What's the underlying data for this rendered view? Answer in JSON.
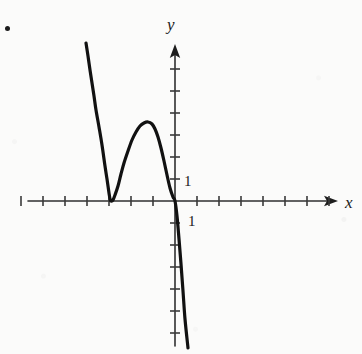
{
  "figure": {
    "kind": "cartesian-graph",
    "background_color": "#fbfbfa",
    "ink_color": "#1a1a1a",
    "width": 362,
    "height": 354,
    "problem_bullet": "•"
  },
  "axes": {
    "x_label": "x",
    "y_label": "y",
    "x_label_pos": {
      "left": 345,
      "top": 194
    },
    "y_label_pos": {
      "left": 167,
      "top": 16
    },
    "origin": {
      "x": 175,
      "y": 201
    },
    "tick_spacing_px": 22,
    "x_axis_start_px": 28,
    "x_axis_end_px": 338,
    "y_axis_top_px": 44,
    "y_axis_bottom_px": 346,
    "x_ticks_left": 7,
    "x_ticks_right": 7,
    "y_ticks_up": 6,
    "y_ticks_down": 7,
    "tick_half_len_px": 5,
    "arrowheads": [
      "x-positive",
      "y-positive"
    ]
  },
  "tick_labels": [
    {
      "name": "y-unit-label",
      "text": "1",
      "left": 184,
      "top": 174
    },
    {
      "name": "x-unit-label",
      "text": "1",
      "left": 188,
      "top": 214
    }
  ],
  "chart_data": {
    "type": "line",
    "title": "",
    "xlabel": "x",
    "ylabel": "y",
    "grid": false,
    "legend": null,
    "axis_units": {
      "x_unit_label": "1",
      "y_unit_label": "1"
    },
    "xlim": [
      -6.7,
      7.4
    ],
    "ylim": [
      -6.6,
      7.1
    ],
    "features": [
      {
        "name": "local-minimum",
        "x": -3.0,
        "y": 0.0,
        "px": [
          110,
          201
        ]
      },
      {
        "name": "local-maximum",
        "x": -1.25,
        "y": 3.6,
        "px": [
          148,
          122
        ]
      },
      {
        "name": "x-intercept-double-root",
        "x": -3.0,
        "y": 0.0,
        "px": [
          110,
          201
        ]
      },
      {
        "name": "origin-crossing",
        "x": 0.0,
        "y": 0.0,
        "px": [
          175,
          201
        ]
      }
    ],
    "series": [
      {
        "name": "curve",
        "stroke": "#111111",
        "stroke_width_px": 3.2,
        "points_px": [
          [
            86,
            43
          ],
          [
            88,
            56
          ],
          [
            90,
            70
          ],
          [
            92,
            83
          ],
          [
            94,
            96
          ],
          [
            96,
            110
          ],
          [
            99,
            127
          ],
          [
            102,
            145
          ],
          [
            105,
            166
          ],
          [
            107,
            179
          ],
          [
            109,
            193
          ],
          [
            110,
            199
          ],
          [
            111,
            201
          ],
          [
            113,
            200
          ],
          [
            115,
            195
          ],
          [
            118,
            186
          ],
          [
            121,
            174
          ],
          [
            124,
            163
          ],
          [
            128,
            151
          ],
          [
            132,
            140
          ],
          [
            136,
            132
          ],
          [
            140,
            126
          ],
          [
            144,
            123
          ],
          [
            148,
            122
          ],
          [
            152,
            124
          ],
          [
            155,
            129
          ],
          [
            158,
            137
          ],
          [
            161,
            148
          ],
          [
            164,
            161
          ],
          [
            167,
            175
          ],
          [
            170,
            188
          ],
          [
            173,
            197
          ],
          [
            175,
            201
          ],
          [
            177,
            216
          ],
          [
            179,
            239
          ],
          [
            181,
            264
          ],
          [
            183,
            291
          ],
          [
            185,
            319
          ],
          [
            188,
            348
          ]
        ]
      }
    ]
  }
}
